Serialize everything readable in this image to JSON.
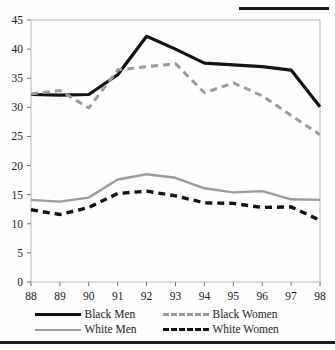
{
  "chart_data": {
    "type": "line",
    "title": "",
    "subtitle": "",
    "xlabel": "",
    "ylabel": "",
    "x": [
      "88",
      "89",
      "90",
      "91",
      "92",
      "93",
      "94",
      "95",
      "96",
      "97",
      "98"
    ],
    "xlim": [
      88,
      98
    ],
    "ylim": [
      0,
      45
    ],
    "yticks": [
      0,
      5,
      10,
      15,
      20,
      25,
      30,
      35,
      40,
      45
    ],
    "grid": false,
    "legend_position": "bottom",
    "series": [
      {
        "name": "Black Men",
        "style": "solid",
        "color": "#121212",
        "values": [
          32.2,
          32.1,
          32.2,
          35.6,
          42.2,
          40.0,
          37.6,
          37.3,
          37.0,
          36.4,
          30.1
        ]
      },
      {
        "name": "Black Women",
        "style": "dashed",
        "color": "#9a9a9a",
        "values": [
          32.3,
          32.9,
          29.9,
          36.4,
          37.0,
          37.5,
          32.5,
          34.2,
          32.0,
          28.6,
          25.3
        ]
      },
      {
        "name": "White Men",
        "style": "solid",
        "color": "#9a9a9a",
        "values": [
          14.1,
          13.8,
          14.5,
          17.6,
          18.5,
          17.9,
          16.1,
          15.4,
          15.6,
          14.2,
          14.1
        ]
      },
      {
        "name": "White Women",
        "style": "dashed",
        "color": "#121212",
        "values": [
          12.4,
          11.6,
          12.8,
          15.2,
          15.6,
          14.8,
          13.6,
          13.5,
          12.8,
          12.9,
          10.6
        ]
      }
    ]
  },
  "legend": {
    "entries": [
      {
        "label": "Black Men"
      },
      {
        "label": "Black Women"
      },
      {
        "label": "White Men"
      },
      {
        "label": "White Women"
      }
    ]
  }
}
